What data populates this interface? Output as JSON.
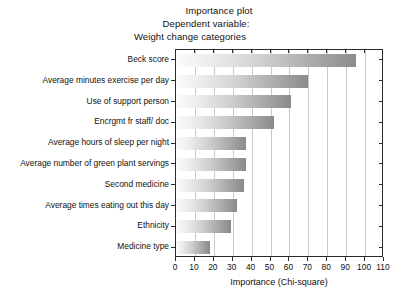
{
  "chart_data": {
    "type": "bar",
    "orientation": "horizontal",
    "title": "Importance plot",
    "subtitle_lines": [
      "Dependent variable:",
      "Weight change categories"
    ],
    "xlabel": "Importance (Chi-square)",
    "ylabel": "",
    "xlim": [
      0,
      110
    ],
    "xticks": [
      0,
      10,
      20,
      30,
      40,
      50,
      60,
      70,
      80,
      90,
      100,
      110
    ],
    "grid": "vertical",
    "legend": "none",
    "categories": [
      "Beck score",
      "Average minutes exercise per day",
      "Use of support person",
      "Encrgmt fr staff/ doc",
      "Average hours of sleep per night",
      "Average number of green plant servings",
      "Second medicine",
      "Average times eating out this day",
      "Ethnicity",
      "Medicine type"
    ],
    "values": [
      95,
      70,
      61,
      52,
      37,
      37,
      36,
      32,
      29,
      18
    ],
    "bar_gradient": {
      "from": "#fbfbfb",
      "to": "#8c8c8c"
    },
    "frame_color": "#2b2b2b",
    "gridline_color": "#c9c9c9"
  }
}
